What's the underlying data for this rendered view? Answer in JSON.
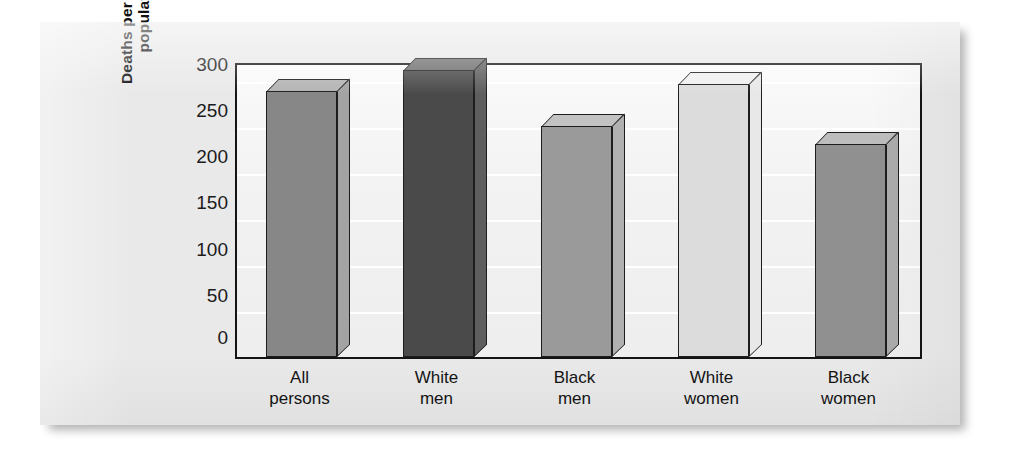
{
  "chart_data": {
    "type": "bar",
    "title": "",
    "subtitle": "",
    "xlabel": "",
    "ylabel": "Deaths per 100,000 population",
    "ylabel_lines": [
      "Deaths per 100,000",
      "population"
    ],
    "categories": [
      "All persons",
      "White men",
      "Black men",
      "White women",
      "Black women"
    ],
    "category_lines": [
      [
        "All",
        "persons"
      ],
      [
        "White",
        "men"
      ],
      [
        "Black",
        "men"
      ],
      [
        "White",
        "women"
      ],
      [
        "Black",
        "women"
      ]
    ],
    "values": [
      279,
      301,
      242,
      286,
      223
    ],
    "ylim": [
      0,
      310
    ],
    "yticks": [
      300,
      250,
      200,
      150,
      100,
      50,
      0
    ],
    "ytick_labels": [
      "300",
      "250",
      "200",
      "150",
      "100",
      "50",
      "0"
    ],
    "grid": true,
    "grid_orientation": "horizontal",
    "legend": "none",
    "style": "3d-column",
    "bar_colors": [
      "#878787",
      "#4a4a4a",
      "#9a9a9a",
      "#dcdcdc",
      "#909090"
    ],
    "bar_top_colors": [
      "#b4b4b4",
      "#6e6e6e",
      "#c2c2c2",
      "#f0f0f0",
      "#bdbdbd"
    ],
    "bar_side_colors": [
      "#a3a3a3",
      "#5e5e5e",
      "#b0b0b0",
      "#e8e8e8",
      "#ababab"
    ]
  },
  "colors": {
    "page_background": "#ffffff",
    "card_background": "#e9e9e9",
    "plot_background": "#f4f4f4",
    "axis": "#141414",
    "gridline": "#ffffff",
    "text": "#141414"
  }
}
